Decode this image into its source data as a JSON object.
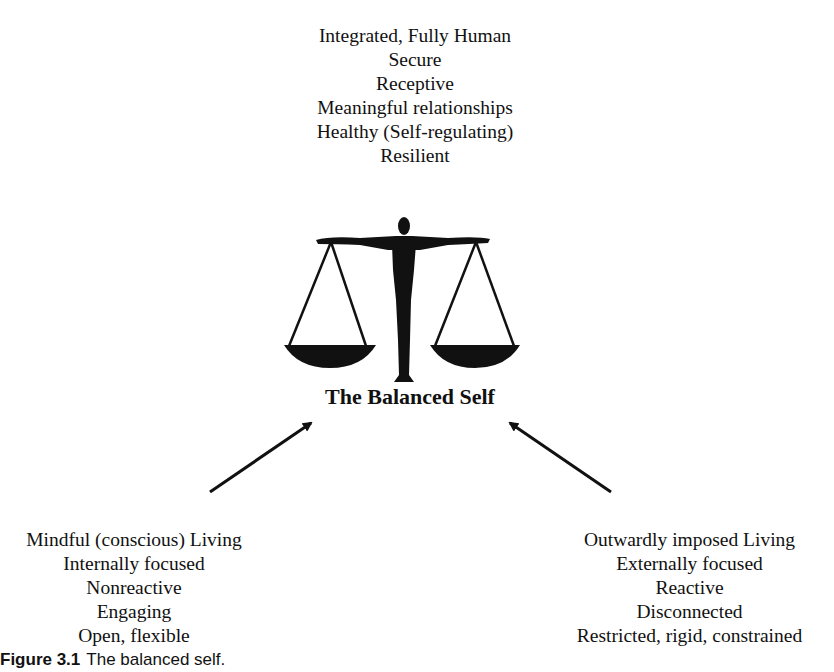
{
  "top_block": {
    "lines": [
      "Integrated, Fully Human",
      "Secure",
      "Receptive",
      "Meaningful relationships",
      "Healthy (Self-regulating)",
      "Resilient"
    ]
  },
  "center": {
    "icon": "balance-scale-human-figure-icon",
    "title": "The Balanced Self"
  },
  "left_block": {
    "lines": [
      "Mindful (conscious) Living",
      "Internally focused",
      "Nonreactive",
      "Engaging",
      "Open, flexible"
    ]
  },
  "right_block": {
    "lines": [
      "Outwardly imposed Living",
      "Externally focused",
      "Reactive",
      "Disconnected",
      "Restricted, rigid, constrained"
    ]
  },
  "caption": {
    "label": "Figure 3.1",
    "text": "The balanced self."
  }
}
